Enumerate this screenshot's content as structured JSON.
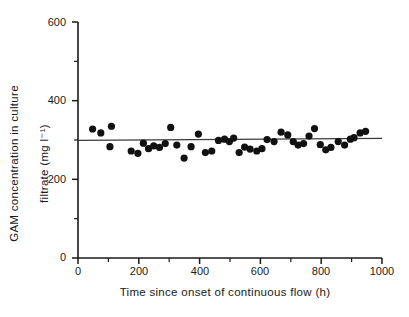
{
  "chart_data": {
    "type": "scatter",
    "title": "",
    "xlabel": "Time since onset of continuous flow (h)",
    "ylabel_line1": "GAM concentration in culture",
    "ylabel_line2": "filtrate (mg l⁻¹)",
    "xlim": [
      0,
      1000
    ],
    "ylim": [
      0,
      600
    ],
    "xticks": [
      0,
      200,
      400,
      600,
      800,
      1000
    ],
    "yticks": [
      0,
      200,
      400,
      600
    ],
    "xtick_minor": [
      100,
      300,
      500,
      700,
      900
    ],
    "ytick_minor": [
      100,
      300,
      500
    ],
    "grid": false,
    "legend": false,
    "marker": "filled-circle",
    "marker_color": "#111111",
    "points": [
      {
        "x": 48,
        "y": 328
      },
      {
        "x": 75,
        "y": 318
      },
      {
        "x": 110,
        "y": 335
      },
      {
        "x": 105,
        "y": 283
      },
      {
        "x": 175,
        "y": 272
      },
      {
        "x": 197,
        "y": 266
      },
      {
        "x": 215,
        "y": 292
      },
      {
        "x": 232,
        "y": 278
      },
      {
        "x": 249,
        "y": 285
      },
      {
        "x": 268,
        "y": 281
      },
      {
        "x": 287,
        "y": 291
      },
      {
        "x": 305,
        "y": 332
      },
      {
        "x": 325,
        "y": 287
      },
      {
        "x": 349,
        "y": 254
      },
      {
        "x": 372,
        "y": 283
      },
      {
        "x": 396,
        "y": 315
      },
      {
        "x": 419,
        "y": 268
      },
      {
        "x": 440,
        "y": 272
      },
      {
        "x": 462,
        "y": 299
      },
      {
        "x": 482,
        "y": 302
      },
      {
        "x": 498,
        "y": 296
      },
      {
        "x": 512,
        "y": 305
      },
      {
        "x": 530,
        "y": 268
      },
      {
        "x": 548,
        "y": 282
      },
      {
        "x": 566,
        "y": 277
      },
      {
        "x": 588,
        "y": 272
      },
      {
        "x": 605,
        "y": 278
      },
      {
        "x": 622,
        "y": 301
      },
      {
        "x": 645,
        "y": 296
      },
      {
        "x": 668,
        "y": 320
      },
      {
        "x": 690,
        "y": 313
      },
      {
        "x": 708,
        "y": 296
      },
      {
        "x": 724,
        "y": 287
      },
      {
        "x": 742,
        "y": 291
      },
      {
        "x": 760,
        "y": 310
      },
      {
        "x": 778,
        "y": 329
      },
      {
        "x": 797,
        "y": 288
      },
      {
        "x": 815,
        "y": 275
      },
      {
        "x": 832,
        "y": 281
      },
      {
        "x": 856,
        "y": 296
      },
      {
        "x": 877,
        "y": 287
      },
      {
        "x": 896,
        "y": 302
      },
      {
        "x": 908,
        "y": 306
      },
      {
        "x": 928,
        "y": 318
      },
      {
        "x": 946,
        "y": 322
      }
    ],
    "fit_line": {
      "label": "regression-line",
      "x_start": 0,
      "y_start": 299,
      "x_end": 1000,
      "y_end": 304,
      "color": "#3b3b3b"
    }
  }
}
